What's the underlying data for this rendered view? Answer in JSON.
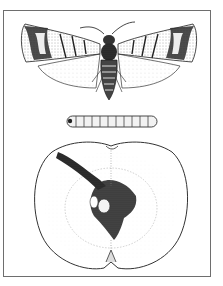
{
  "illustration": {
    "subject": "Codling moth life stages and apple damage",
    "panels": [
      {
        "id": "moth",
        "label": "adult moth, wings spread"
      },
      {
        "id": "larva",
        "label": "larva (caterpillar)"
      },
      {
        "id": "apple",
        "label": "apple cut in half showing larval tunnel"
      }
    ]
  },
  "colors": {
    "ink": "#1a1a1a",
    "frame": "#6e6e6e",
    "paper": "#ffffff"
  }
}
